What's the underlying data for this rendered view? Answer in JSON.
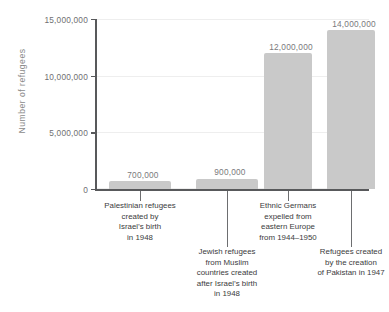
{
  "chart_data": {
    "type": "bar",
    "title": "",
    "subtitle": "",
    "xlabel": "",
    "ylabel": "Number of refugees",
    "ylim": [
      0,
      15000000
    ],
    "grid": true,
    "legend": false,
    "legend_position": "none",
    "bar_color": "#c9c9c9",
    "axis_color": "#58595b",
    "label_color": "#3b3b3d",
    "value_label_color": "#7a7a7c",
    "tick_label_color": "#6f7072",
    "ylabel_color": "#8a8a8a",
    "gridline_color": "#eeeeee",
    "y_ticks": [
      0,
      5000000,
      10000000,
      15000000
    ],
    "y_tick_labels": [
      "0",
      "5,000,000",
      "10,000,000",
      "15,000,000"
    ],
    "categories": [
      "Palestinian refugees created by Israel's birth in 1948",
      "Jewish refugees from Muslim countries created after Israel's birth in 1948",
      "Ethnic Germans expelled from eastern Europe from 1944–1950",
      "Refugees created by the creation of Pakistan in 1947"
    ],
    "values": [
      700000,
      900000,
      12000000,
      14000000
    ],
    "value_labels": [
      "700,000",
      "900,000",
      "12,000,000",
      "14,000,000"
    ],
    "category_label_lines": [
      [
        "Palestinian refugees",
        "created by",
        "Israel’s birth",
        "in 1948"
      ],
      [
        "Jewish refugees",
        "from Muslim",
        "countries created",
        "after Israel’s birth",
        "in 1948"
      ],
      [
        "Ethnic Germans",
        "expelled from",
        "eastern Europe",
        "from 1944–1950"
      ],
      [
        "Refugees created",
        "by the creation",
        "of Pakistan in 1947"
      ]
    ]
  }
}
